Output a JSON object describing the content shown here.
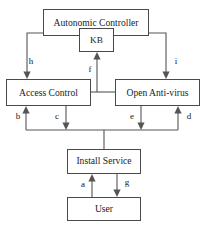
{
  "diagram": {
    "background_color": "#ffffff",
    "box_stroke_color": "#4a4a4a",
    "edge_color": "#555555",
    "text_color": "#1c1c1c",
    "nodes": [
      {
        "id": "autonomic-controller",
        "label": "Autonomic Controller",
        "x": 43,
        "y": 9,
        "w": 106,
        "h": 27
      },
      {
        "id": "kb",
        "label": "KB",
        "x": 79,
        "y": 28,
        "w": 35,
        "h": 24
      },
      {
        "id": "access-control",
        "label": "Access Control",
        "x": 6,
        "y": 79,
        "w": 85,
        "h": 27
      },
      {
        "id": "open-anti-virus",
        "label": "Open Anti-virus",
        "x": 115,
        "y": 79,
        "w": 85,
        "h": 27
      },
      {
        "id": "install-service",
        "label": "Install Service",
        "x": 67,
        "y": 149,
        "w": 74,
        "h": 25
      },
      {
        "id": "user",
        "label": "User",
        "x": 67,
        "y": 197,
        "w": 74,
        "h": 24
      }
    ],
    "edges": [
      {
        "id": "edge-h",
        "label": "h",
        "label_x": 31,
        "label_y": 62,
        "from": "autonomic-controller",
        "to": "access-control"
      },
      {
        "id": "edge-i",
        "label": "i",
        "label_x": 176,
        "label_y": 62,
        "from": "autonomic-controller",
        "to": "open-anti-virus"
      },
      {
        "id": "edge-f",
        "label": "f",
        "label_x": 97,
        "label_y": 70,
        "from": "middle-bus",
        "to": "kb"
      },
      {
        "id": "edge-b",
        "label": "b",
        "label_x": 20,
        "label_y": 117,
        "from": "bottom-bus",
        "to": "access-control"
      },
      {
        "id": "edge-c",
        "label": "c",
        "label_x": 56,
        "label_y": 117,
        "from": "access-control",
        "to": "bottom-bus"
      },
      {
        "id": "edge-e",
        "label": "e",
        "label_x": 131,
        "label_y": 117,
        "from": "open-anti-virus",
        "to": "bottom-bus"
      },
      {
        "id": "edge-d",
        "label": "d",
        "label_x": 190,
        "label_y": 117,
        "from": "bottom-bus",
        "to": "open-anti-virus"
      },
      {
        "id": "edge-a",
        "label": "a",
        "label_x": 82,
        "label_y": 185,
        "from": "user",
        "to": "install-service"
      },
      {
        "id": "edge-g",
        "label": "g",
        "label_x": 126,
        "label_y": 183,
        "from": "install-service",
        "to": "user"
      }
    ]
  }
}
